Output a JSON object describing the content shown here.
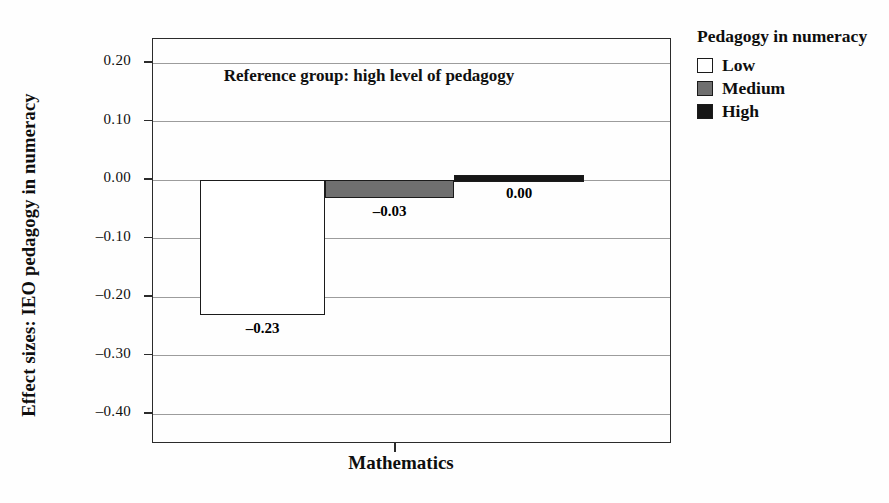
{
  "figure": {
    "background": "#fefefe",
    "frame_color": "#2b2b2b",
    "gridline_color": "#9c9c9c"
  },
  "legend": {
    "title": "Pedagogy in numeracy",
    "items": [
      {
        "label": "Low",
        "color": "#ffffff"
      },
      {
        "label": "Medium",
        "color": "#6f6f6f"
      },
      {
        "label": "High",
        "color": "#161616"
      }
    ]
  },
  "chart_data": {
    "type": "bar",
    "title": "",
    "categories": [
      "Mathematics"
    ],
    "series": [
      {
        "name": "Low",
        "values": [
          -0.23
        ],
        "label": "–0.23",
        "color": "#ffffff"
      },
      {
        "name": "Medium",
        "values": [
          -0.03
        ],
        "label": "–0.03",
        "color": "#6f6f6f"
      },
      {
        "name": "High",
        "values": [
          0.0
        ],
        "label": "0.00",
        "color": "#161616"
      }
    ],
    "xlabel": "",
    "ylabel": "Effect sizes: IEO pedagogy in numeracy",
    "ylim": [
      -0.45,
      0.24
    ],
    "yticks": [
      {
        "label": "0.20",
        "value": 0.2
      },
      {
        "label": "0.10",
        "value": 0.1
      },
      {
        "label": "0.00",
        "value": 0.0
      },
      {
        "label": "–0.10",
        "value": -0.1
      },
      {
        "label": "–0.20",
        "value": -0.2
      },
      {
        "label": "–0.30",
        "value": -0.3
      },
      {
        "label": "–0.40",
        "value": -0.4
      }
    ],
    "grid": true,
    "legend_position": "outside-top-right",
    "annotation": "Reference group: high level of pedagogy"
  }
}
